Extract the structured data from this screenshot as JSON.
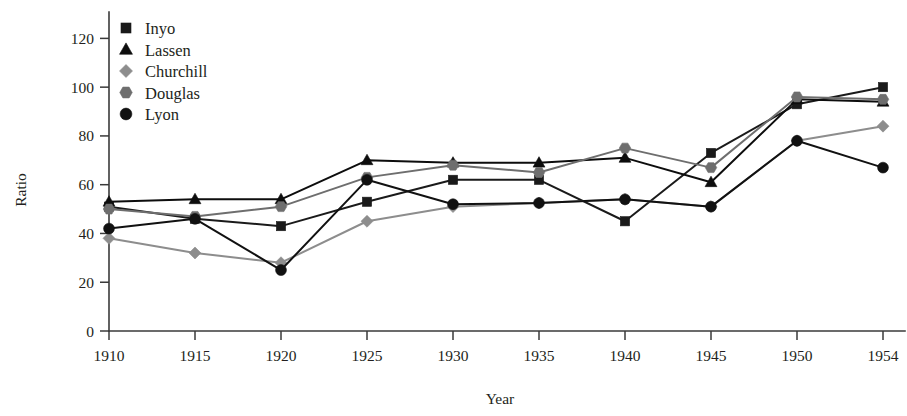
{
  "chart_data": {
    "type": "line",
    "title": "",
    "xlabel": "Year",
    "ylabel": "Ratio",
    "x": [
      1910,
      1915,
      1920,
      1925,
      1930,
      1935,
      1940,
      1945,
      1950,
      1954
    ],
    "xtick_labels": [
      "1910",
      "1915",
      "1920",
      "1925",
      "1930",
      "1935",
      "1940",
      "1945",
      "1950",
      "1954"
    ],
    "ytick_labels": [
      "0",
      "20",
      "40",
      "60",
      "80",
      "100",
      "120"
    ],
    "yticks": [
      0,
      20,
      40,
      60,
      80,
      100,
      120
    ],
    "ylim": [
      0,
      130
    ],
    "grid": false,
    "legend_position": "top-left",
    "series": [
      {
        "name": "Inyo",
        "marker": "square",
        "color": "#1a1a1a",
        "values": [
          51,
          46,
          43,
          53,
          62,
          62,
          45,
          73,
          93,
          100
        ]
      },
      {
        "name": "Lassen",
        "marker": "triangle",
        "color": "#0d0d0d",
        "values": [
          53,
          54,
          54,
          70,
          69,
          69,
          71,
          61,
          95,
          94
        ]
      },
      {
        "name": "Churchill",
        "marker": "diamond",
        "color": "#8d8d8d",
        "values": [
          38,
          32,
          28,
          45,
          51,
          52.5,
          54,
          51,
          78,
          84
        ]
      },
      {
        "name": "Douglas",
        "marker": "hexagon",
        "color": "#6e6e6e",
        "values": [
          50,
          47,
          51,
          63,
          68,
          65,
          75,
          67,
          96,
          95
        ]
      },
      {
        "name": "Lyon",
        "marker": "circle",
        "color": "#111111",
        "values": [
          42,
          46,
          25,
          62,
          52,
          52.5,
          54,
          51,
          78,
          67
        ]
      }
    ]
  }
}
